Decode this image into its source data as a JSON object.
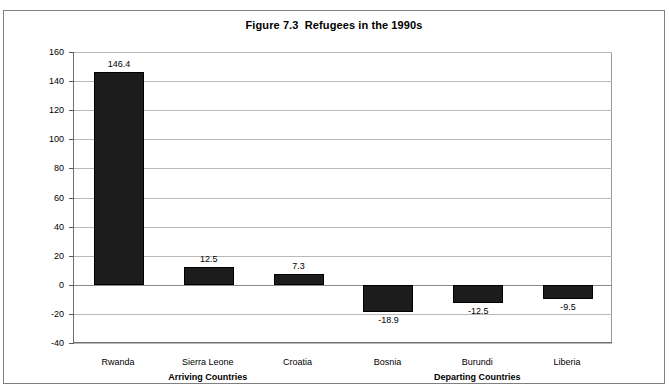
{
  "chart_data": {
    "type": "bar",
    "title": "Figure 7.3  Refugees in the 1990s",
    "categories": [
      "Rwanda",
      "Sierra Leone",
      "Croatia",
      "Bosnia",
      "Burundi",
      "Liberia"
    ],
    "values": [
      146.4,
      12.5,
      7.3,
      -18.9,
      -12.5,
      -9.5
    ],
    "value_labels": [
      "146.4",
      "12.5",
      "7.3",
      "-18.9",
      "-12.5",
      "-9.5"
    ],
    "xlabel": "",
    "ylabel": "",
    "ylim": [
      -40,
      160
    ],
    "ytick_step": 20,
    "yticks": [
      160,
      140,
      120,
      100,
      80,
      60,
      40,
      20,
      0,
      -20,
      -40
    ],
    "ytick_labels": [
      "160",
      "140",
      "120",
      "100",
      "80",
      "60",
      "40",
      "20",
      "0",
      "-20",
      "-40"
    ],
    "grid": true,
    "legend": false,
    "bar_color": "#1c1c1c",
    "gridline_color": "#b9b9b9",
    "axis_color": "#6e6e6e",
    "group_labels": [
      {
        "label": "Arriving Countries",
        "categories": [
          "Rwanda",
          "Sierra Leone",
          "Croatia"
        ]
      },
      {
        "label": "Departing Countries",
        "categories": [
          "Bosnia",
          "Burundi",
          "Liberia"
        ]
      }
    ]
  }
}
